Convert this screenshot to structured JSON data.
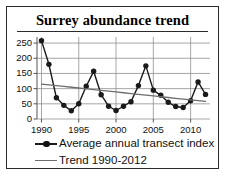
{
  "chart_data": {
    "type": "line",
    "title": "Surrey abundance trend",
    "xlabel": "",
    "ylabel": "",
    "xlim": [
      1989.4,
      2012.6
    ],
    "ylim": [
      0,
      270
    ],
    "ytick_values": [
      0,
      50,
      100,
      150,
      200,
      250
    ],
    "ytick_labels": [
      "0",
      "50",
      "100",
      "150",
      "200",
      "250"
    ],
    "xtick_values": [
      1990,
      1995,
      2000,
      2005,
      2010
    ],
    "xtick_labels": [
      "1990",
      "1995",
      "2000",
      "2005",
      "2010"
    ],
    "grid": "horizontal-and-vertical-at-xticks",
    "legend_position": "below-plot-left",
    "x": [
      1990,
      1991,
      1992,
      1993,
      1994,
      1995,
      1996,
      1997,
      1998,
      1999,
      2000,
      2001,
      2002,
      2003,
      2004,
      2005,
      2006,
      2007,
      2008,
      2009,
      2010,
      2011,
      2012
    ],
    "series": [
      {
        "name": "Average annual transect index",
        "type": "line-with-markers",
        "color": "#1a1a1a",
        "marker": "filled-circle",
        "values": [
          258,
          180,
          70,
          45,
          27,
          50,
          108,
          157,
          80,
          42,
          28,
          42,
          57,
          110,
          175,
          95,
          78,
          55,
          41,
          38,
          60,
          122,
          81
        ]
      },
      {
        "name": "Trend 1990-2012",
        "type": "line",
        "color": "#6e6e6e",
        "marker": "none",
        "endpoints": [
          {
            "x": 1990,
            "y": 115
          },
          {
            "x": 2012,
            "y": 58
          }
        ],
        "values": [
          115,
          112.4,
          109.8,
          107.2,
          104.6,
          102,
          99.4,
          96.8,
          94.2,
          91.6,
          89,
          86.4,
          83.8,
          81.2,
          78.6,
          76,
          73.4,
          70.8,
          68.2,
          65.6,
          63,
          60.4,
          58
        ]
      }
    ]
  },
  "legend": {
    "items": [
      {
        "label": "Average annual transect index",
        "key": "line-marker-key"
      },
      {
        "label": "Trend 1990-2012",
        "key": "line-key"
      }
    ]
  },
  "colors": {
    "series_line": "#1a1a1a",
    "trend_line": "#6e6e6e",
    "grid": "#8f8f8f",
    "axis": "#555555",
    "border": "#2b2b2b",
    "text": "#111111",
    "background": "#ffffff"
  }
}
